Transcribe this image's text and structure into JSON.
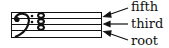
{
  "diagram": {
    "clef": "bass-clef",
    "chord_notes": 3,
    "labels": [
      {
        "text": "fifth"
      },
      {
        "text": "third"
      },
      {
        "text": "root"
      }
    ]
  }
}
